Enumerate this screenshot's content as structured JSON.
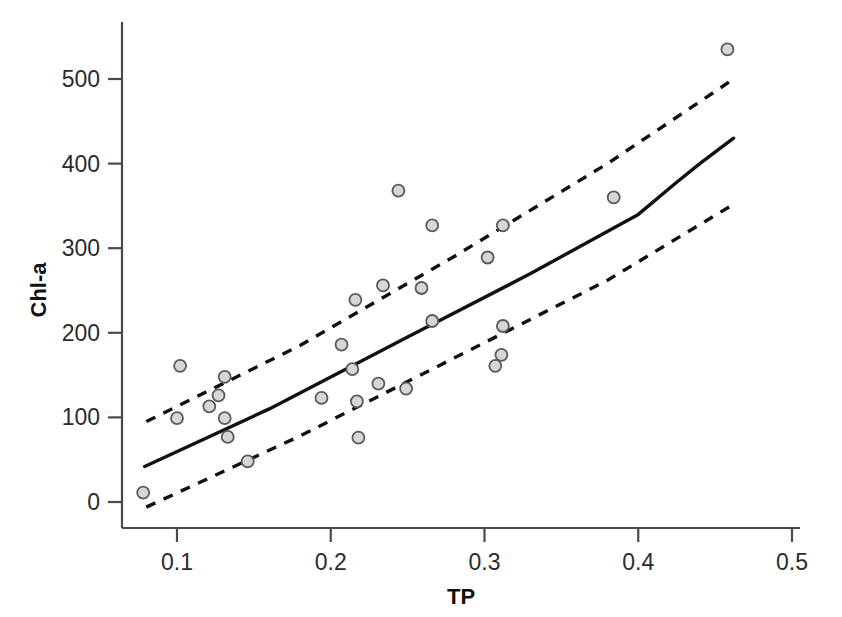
{
  "chart_data": {
    "type": "scatter",
    "title": "",
    "subtitle": "",
    "xlabel": "TP",
    "ylabel": "Chl-a",
    "xlim": [
      0.063,
      0.505
    ],
    "ylim": [
      -35,
      560
    ],
    "xticks": [
      "0.1",
      "0.2",
      "0.3",
      "0.4",
      "0.5"
    ],
    "xtick_values": [
      0.1,
      0.2,
      0.3,
      0.4,
      0.5
    ],
    "yticks": [
      "0",
      "100",
      "200",
      "300",
      "400",
      "500"
    ],
    "ytick_values": [
      0,
      100,
      200,
      300,
      400,
      500
    ],
    "grid": false,
    "legend": null,
    "marker": {
      "shape": "circle",
      "fill_color": "#d6d6d6",
      "edge_color": "#5a5a5a",
      "size_px": 11
    },
    "points": [
      {
        "x": 0.078,
        "y": 11
      },
      {
        "x": 0.1,
        "y": 99
      },
      {
        "x": 0.102,
        "y": 161
      },
      {
        "x": 0.121,
        "y": 113
      },
      {
        "x": 0.127,
        "y": 126
      },
      {
        "x": 0.131,
        "y": 148
      },
      {
        "x": 0.131,
        "y": 99
      },
      {
        "x": 0.133,
        "y": 77
      },
      {
        "x": 0.146,
        "y": 48
      },
      {
        "x": 0.194,
        "y": 123
      },
      {
        "x": 0.207,
        "y": 186
      },
      {
        "x": 0.214,
        "y": 157
      },
      {
        "x": 0.216,
        "y": 239
      },
      {
        "x": 0.217,
        "y": 119
      },
      {
        "x": 0.218,
        "y": 76
      },
      {
        "x": 0.231,
        "y": 140
      },
      {
        "x": 0.234,
        "y": 256
      },
      {
        "x": 0.244,
        "y": 368
      },
      {
        "x": 0.249,
        "y": 134
      },
      {
        "x": 0.259,
        "y": 253
      },
      {
        "x": 0.266,
        "y": 214
      },
      {
        "x": 0.266,
        "y": 327
      },
      {
        "x": 0.302,
        "y": 289
      },
      {
        "x": 0.307,
        "y": 161
      },
      {
        "x": 0.311,
        "y": 174
      },
      {
        "x": 0.312,
        "y": 208
      },
      {
        "x": 0.312,
        "y": 327
      },
      {
        "x": 0.384,
        "y": 360
      },
      {
        "x": 0.458,
        "y": 535
      }
    ],
    "regression_line": {
      "name": "fitted regression line",
      "style": "solid",
      "color": "#111111",
      "points": [
        {
          "x": 0.079,
          "y": 42
        },
        {
          "x": 0.16,
          "y": 110
        },
        {
          "x": 0.25,
          "y": 195
        },
        {
          "x": 0.33,
          "y": 270
        },
        {
          "x": 0.4,
          "y": 340
        },
        {
          "x": 0.425,
          "y": 378
        },
        {
          "x": 0.44,
          "y": 400
        },
        {
          "x": 0.462,
          "y": 430
        }
      ]
    },
    "confidence_bands": [
      {
        "name": "upper confidence limit",
        "style": "dashed",
        "color": "#111111",
        "points": [
          {
            "x": 0.08,
            "y": 95
          },
          {
            "x": 0.18,
            "y": 185
          },
          {
            "x": 0.28,
            "y": 290
          },
          {
            "x": 0.38,
            "y": 400
          },
          {
            "x": 0.462,
            "y": 500
          }
        ]
      },
      {
        "name": "lower confidence limit",
        "style": "dashed",
        "color": "#111111",
        "points": [
          {
            "x": 0.08,
            "y": -6
          },
          {
            "x": 0.18,
            "y": 78
          },
          {
            "x": 0.28,
            "y": 170
          },
          {
            "x": 0.38,
            "y": 262
          },
          {
            "x": 0.462,
            "y": 352
          }
        ]
      }
    ]
  }
}
